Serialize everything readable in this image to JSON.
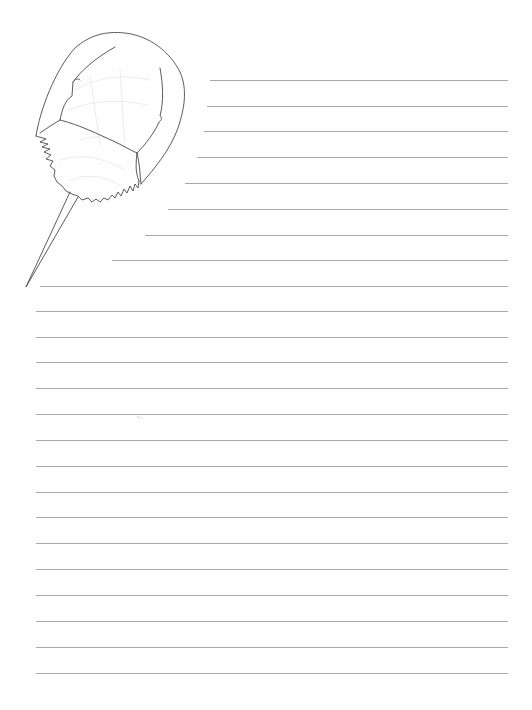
{
  "page": {
    "type": "lined writing paper",
    "background_color": "#fefefe",
    "rule_color": "#a9a9a9",
    "illustration": {
      "subject": "horseshoe crab line drawing",
      "icon": "horseshoe-crab-icon",
      "stroke_color": "#4a4a4a"
    },
    "rules": [
      {
        "y": 80,
        "x_start": 210,
        "x_end": 508
      },
      {
        "y": 106,
        "x_start": 207,
        "x_end": 508
      },
      {
        "y": 131,
        "x_start": 204,
        "x_end": 508
      },
      {
        "y": 157,
        "x_start": 197,
        "x_end": 508
      },
      {
        "y": 183,
        "x_start": 185,
        "x_end": 508
      },
      {
        "y": 209,
        "x_start": 168,
        "x_end": 508
      },
      {
        "y": 235,
        "x_start": 145,
        "x_end": 508
      },
      {
        "y": 260,
        "x_start": 112,
        "x_end": 508
      },
      {
        "y": 286,
        "x_start": 40,
        "x_end": 508
      },
      {
        "y": 311,
        "x_start": 36,
        "x_end": 508
      },
      {
        "y": 337,
        "x_start": 36,
        "x_end": 508
      },
      {
        "y": 362,
        "x_start": 36,
        "x_end": 508
      },
      {
        "y": 388,
        "x_start": 36,
        "x_end": 508
      },
      {
        "y": 414,
        "x_start": 36,
        "x_end": 508
      },
      {
        "y": 440,
        "x_start": 36,
        "x_end": 508
      },
      {
        "y": 466,
        "x_start": 36,
        "x_end": 508
      },
      {
        "y": 492,
        "x_start": 36,
        "x_end": 508
      },
      {
        "y": 517,
        "x_start": 36,
        "x_end": 508
      },
      {
        "y": 543,
        "x_start": 36,
        "x_end": 508
      },
      {
        "y": 569,
        "x_start": 36,
        "x_end": 508
      },
      {
        "y": 595,
        "x_start": 36,
        "x_end": 508
      },
      {
        "y": 621,
        "x_start": 36,
        "x_end": 508
      },
      {
        "y": 647,
        "x_start": 36,
        "x_end": 508
      },
      {
        "y": 673,
        "x_start": 36,
        "x_end": 508
      }
    ]
  }
}
